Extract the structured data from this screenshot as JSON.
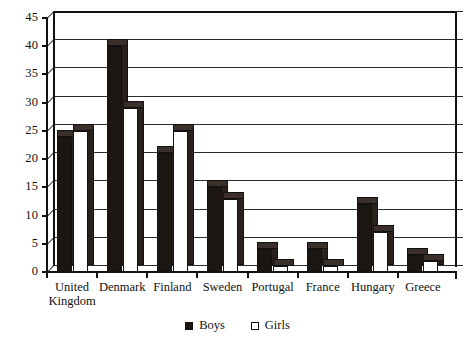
{
  "chart_data": {
    "type": "bar",
    "title": "",
    "subtitle": "",
    "xlabel": "",
    "ylabel": "",
    "ylim": [
      0,
      45
    ],
    "ytick_step": 5,
    "yticks": [
      "0",
      "5",
      "10",
      "15",
      "20",
      "25",
      "30",
      "35",
      "40",
      "45"
    ],
    "grid": true,
    "grid_axis": "y",
    "legend_position": "bottom-center",
    "style": "3d-clustered-column",
    "categories": [
      "United\nKingdom",
      "Denmark",
      "Finland",
      "Sweden",
      "Portugal",
      "France",
      "Hungary",
      "Greece"
    ],
    "series": [
      {
        "name": "Boys",
        "color": "#1c1613",
        "fill": "solid-black",
        "values": [
          24,
          40,
          21,
          15,
          4,
          4,
          12,
          3
        ]
      },
      {
        "name": "Girls",
        "color": "#ffffff",
        "fill": "hollow-white",
        "values": [
          25,
          29,
          25,
          13,
          1,
          1,
          7,
          2
        ]
      }
    ]
  },
  "legend": {
    "entries": [
      {
        "label": "Boys",
        "swatch": "filled-square-icon"
      },
      {
        "label": "Girls",
        "swatch": "hollow-square-icon"
      }
    ]
  },
  "colors": {
    "axis": "#111111",
    "gridline": "#2b2b2b",
    "bar_boys": "#1c1613",
    "bar_girls": "#ffffff",
    "bar_top": "#3a2f2a",
    "bar_side": "#2a211d",
    "background": "#ffffff"
  }
}
